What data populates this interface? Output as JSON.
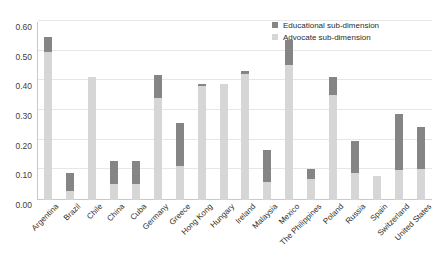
{
  "chart_data": {
    "type": "bar",
    "stacked": true,
    "title": "",
    "xlabel": "",
    "ylabel": "",
    "ylim": [
      0.0,
      0.6
    ],
    "ytick_labels": [
      "0.00",
      "0.10",
      "0.20",
      "0.30",
      "0.40",
      "0.50",
      "0.60"
    ],
    "ytick_values": [
      0.0,
      0.1,
      0.2,
      0.3,
      0.4,
      0.5,
      0.6
    ],
    "grid": true,
    "legend_position": "top-right",
    "categories": [
      "Argentina",
      "Brazil",
      "Chile",
      "China",
      "Cuba",
      "Germany",
      "Greece",
      "Hong Kong",
      "Hungary",
      "Ireland",
      "Malaysia",
      "Mexico",
      "The Philippines",
      "Poland",
      "Russia",
      "Spain",
      "Switzerland",
      "United States"
    ],
    "series": [
      {
        "name": "Advocate sub-dimension",
        "color": "#d6d6d6",
        "values": [
          0.5,
          0.03,
          0.415,
          0.055,
          0.055,
          0.345,
          0.115,
          0.385,
          0.39,
          0.425,
          0.06,
          0.455,
          0.07,
          0.355,
          0.09,
          0.08,
          0.1,
          0.105
        ]
      },
      {
        "name": "Educational sub-dimension",
        "color": "#858585",
        "values": [
          0.05,
          0.06,
          0.0,
          0.075,
          0.075,
          0.075,
          0.145,
          0.005,
          0.0,
          0.01,
          0.11,
          0.085,
          0.035,
          0.06,
          0.11,
          0.0,
          0.19,
          0.14
        ]
      }
    ],
    "totals": [
      0.55,
      0.09,
      0.415,
      0.13,
      0.13,
      0.42,
      0.26,
      0.39,
      0.39,
      0.435,
      0.17,
      0.54,
      0.105,
      0.415,
      0.2,
      0.08,
      0.29,
      0.245
    ]
  },
  "legend": {
    "items": [
      {
        "label": "Educational sub-dimension"
      },
      {
        "label": "Advocate sub-dimension"
      }
    ]
  }
}
